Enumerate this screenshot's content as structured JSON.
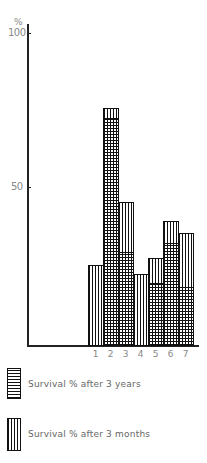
{
  "chart_data": {
    "type": "bar",
    "stacked_overlay": true,
    "title": "",
    "xlabel": "",
    "ylabel": "%",
    "ylim": [
      0,
      100
    ],
    "yticks": [
      50,
      100
    ],
    "categories": [
      "1",
      "2",
      "3",
      "4",
      "5",
      "6",
      "7"
    ],
    "series": [
      {
        "name": "Survival % after 3 months",
        "pattern": "vertical-lines",
        "values": [
          26,
          76,
          46,
          23,
          28,
          40,
          36
        ]
      },
      {
        "name": "Survival % after 3 years",
        "pattern": "grid",
        "values": [
          0,
          73,
          30,
          0,
          20,
          33,
          19
        ]
      }
    ],
    "legend_position": "bottom-left",
    "grid": false
  },
  "axis": {
    "y_unit": "%",
    "tick_100": "100",
    "tick_50": "50"
  },
  "legend": {
    "years": "Survival % after 3 years",
    "months": "Survival % after 3 months"
  }
}
